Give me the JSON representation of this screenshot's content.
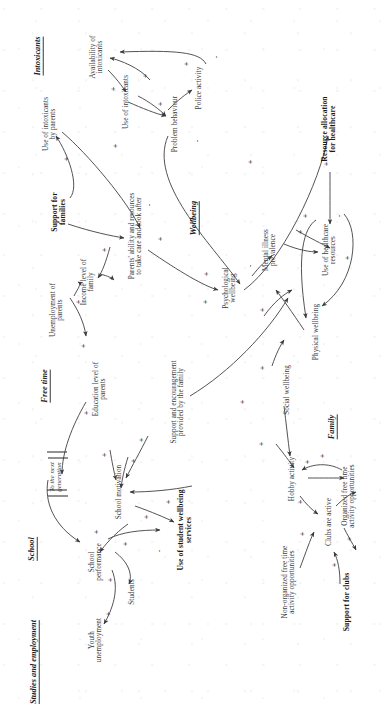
{
  "diagram": {
    "orientation": "rotated-90-ccw",
    "sections": [
      {
        "id": "studies",
        "label": "Studies and\nemployment",
        "x": 40,
        "y": 34
      },
      {
        "id": "school",
        "label": "School",
        "x": 153,
        "y": 32
      },
      {
        "id": "freetime",
        "label": "Free time",
        "x": 316,
        "y": 45
      },
      {
        "id": "family",
        "label": "Family",
        "x": 275,
        "y": 332
      },
      {
        "id": "wellbeing",
        "label": "Wellbeing",
        "x": 484,
        "y": 194
      },
      {
        "id": "intoxicants",
        "label": "Intoxicants",
        "x": 646,
        "y": 38
      }
    ],
    "nodes": [
      {
        "id": "youth_unemployment",
        "label": "Youth\nunemployment",
        "x": 62,
        "y": 96,
        "bold": false
      },
      {
        "id": "students",
        "label": "Students",
        "x": 110,
        "y": 133,
        "bold": false
      },
      {
        "id": "school_performance",
        "label": "School\nperformance",
        "x": 140,
        "y": 96,
        "bold": false
      },
      {
        "id": "school_motivation",
        "label": "School motivation",
        "x": 210,
        "y": 120,
        "bold": false
      },
      {
        "id": "use_student_wellbeing_services",
        "label": "Use of student wellbeing\nservices",
        "x": 172,
        "y": 185,
        "bold": true
      },
      {
        "id": "education_level_parents",
        "label": "Education level of\nparents",
        "x": 313,
        "y": 100,
        "bold": false
      },
      {
        "id": "support_encouragement_family",
        "label": "Support and encouragement\nprovided by the family",
        "x": 300,
        "y": 178,
        "bold": false
      },
      {
        "id": "income_level_family",
        "label": "Income level of\nfamily",
        "x": 420,
        "y": 88,
        "bold": false
      },
      {
        "id": "unemployment_parents",
        "label": "Unemployment of\nparents",
        "x": 392,
        "y": 57,
        "bold": false
      },
      {
        "id": "parents_ability",
        "label": "Parents' ability and resources\nto take care and look after",
        "x": 466,
        "y": 136,
        "bold": false
      },
      {
        "id": "support_for_families",
        "label": "Support for\nfamilies",
        "x": 490,
        "y": 59,
        "bold": true
      },
      {
        "id": "use_intoxicants_parents",
        "label": "Use of intoxicants\nby parents",
        "x": 578,
        "y": 50,
        "bold": false
      },
      {
        "id": "use_intoxicants",
        "label": "Use of intoxicants",
        "x": 600,
        "y": 127,
        "bold": false
      },
      {
        "id": "availability_intoxicants",
        "label": "Availability of\nintoxicants",
        "x": 645,
        "y": 97,
        "bold": false
      },
      {
        "id": "problem_behaviour",
        "label": "Problem behaviour",
        "x": 578,
        "y": 176,
        "bold": false
      },
      {
        "id": "police_activity",
        "label": "Police activity",
        "x": 614,
        "y": 200,
        "bold": false
      },
      {
        "id": "psychological_wellbeing",
        "label": "Psychological\nwellbeing",
        "x": 414,
        "y": 230,
        "bold": false
      },
      {
        "id": "mental_illness_prevalence",
        "label": "Mental illness\nprevalence",
        "x": 452,
        "y": 270,
        "bold": false
      },
      {
        "id": "use_healthcare_resources",
        "label": "Use of healthcare\nresources",
        "x": 452,
        "y": 330,
        "bold": false
      },
      {
        "id": "physical_wellbeing",
        "label": "Physical wellbeing",
        "x": 370,
        "y": 317,
        "bold": false
      },
      {
        "id": "social_wellbeing",
        "label": "Social wellbeing",
        "x": 312,
        "y": 288,
        "bold": false
      },
      {
        "id": "hobby_activity",
        "label": "Hobby activity",
        "x": 223,
        "y": 293,
        "bold": false
      },
      {
        "id": "clubs_are_active",
        "label": "Clubs are active",
        "x": 180,
        "y": 330,
        "bold": false
      },
      {
        "id": "non_organized_opportunities",
        "label": "Non-organized free time\nactivity opportunities",
        "x": 120,
        "y": 289,
        "bold": false
      },
      {
        "id": "organized_opportunities",
        "label": "Organized free time\nactivity opportunities",
        "x": 206,
        "y": 349,
        "bold": false
      },
      {
        "id": "support_for_clubs",
        "label": "Support for clubs",
        "x": 100,
        "y": 347,
        "bold": true
      },
      {
        "id": "resource_allocation_healthcare",
        "label": "Resource allocation\nfor healthcare",
        "x": 573,
        "y": 329,
        "bold": true
      }
    ],
    "delay_label": {
      "text": "To the next\ngeneration",
      "x": 225,
      "y": 55
    },
    "link_signs": [
      {
        "sign": "+",
        "x": 88,
        "y": 108
      },
      {
        "sign": "+",
        "x": 122,
        "y": 110
      },
      {
        "sign": "+",
        "x": 158,
        "y": 125
      },
      {
        "sign": "+",
        "x": 170,
        "y": 96
      },
      {
        "sign": "+",
        "x": 185,
        "y": 146
      },
      {
        "sign": "+",
        "x": 200,
        "y": 168
      },
      {
        "sign": "-",
        "x": 151,
        "y": 158
      },
      {
        "sign": "+",
        "x": 241,
        "y": 133
      },
      {
        "sign": "+",
        "x": 247,
        "y": 104
      },
      {
        "sign": "+",
        "x": 262,
        "y": 141
      },
      {
        "sign": "+",
        "x": 289,
        "y": 86
      },
      {
        "sign": "+",
        "x": 356,
        "y": 83
      },
      {
        "sign": "+",
        "x": 400,
        "y": 78
      },
      {
        "sign": "-",
        "x": 423,
        "y": 110
      },
      {
        "sign": "+",
        "x": 452,
        "y": 104
      },
      {
        "sign": "+",
        "x": 463,
        "y": 160
      },
      {
        "sign": "-",
        "x": 497,
        "y": 148
      },
      {
        "sign": "+",
        "x": 543,
        "y": 66
      },
      {
        "sign": "+",
        "x": 556,
        "y": 115
      },
      {
        "sign": "+",
        "x": 613,
        "y": 113
      },
      {
        "sign": "+",
        "x": 626,
        "y": 145
      },
      {
        "sign": "+",
        "x": 598,
        "y": 160
      },
      {
        "sign": "+",
        "x": 638,
        "y": 186
      },
      {
        "sign": "-",
        "x": 645,
        "y": 215
      },
      {
        "sign": "-",
        "x": 561,
        "y": 196
      },
      {
        "sign": "+",
        "x": 400,
        "y": 205
      },
      {
        "sign": "+",
        "x": 428,
        "y": 206
      },
      {
        "sign": "-",
        "x": 436,
        "y": 249
      },
      {
        "sign": "-",
        "x": 443,
        "y": 268
      },
      {
        "sign": "+",
        "x": 470,
        "y": 300
      },
      {
        "sign": "+",
        "x": 486,
        "y": 305
      },
      {
        "sign": "-",
        "x": 486,
        "y": 338
      },
      {
        "sign": "+",
        "x": 444,
        "y": 347
      },
      {
        "sign": "+",
        "x": 538,
        "y": 326
      },
      {
        "sign": "+",
        "x": 392,
        "y": 262
      },
      {
        "sign": "+",
        "x": 334,
        "y": 262
      },
      {
        "sign": "+",
        "x": 300,
        "y": 242
      },
      {
        "sign": "+",
        "x": 258,
        "y": 261
      },
      {
        "sign": "+",
        "x": 240,
        "y": 307
      },
      {
        "sign": "+",
        "x": 200,
        "y": 300
      },
      {
        "sign": "+",
        "x": 168,
        "y": 302
      },
      {
        "sign": "+",
        "x": 163,
        "y": 349
      },
      {
        "sign": "+",
        "x": 137,
        "y": 334
      },
      {
        "sign": "+",
        "x": 246,
        "y": 322
      },
      {
        "sign": "+",
        "x": 540,
        "y": 250
      }
    ]
  }
}
